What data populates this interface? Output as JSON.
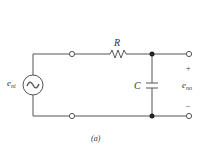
{
  "figure": {
    "caption": "(a)",
    "type": "RC low-pass circuit",
    "wire_color": "#555555"
  },
  "labels": {
    "resistor": "R",
    "capacitor": "C",
    "input_main": "e",
    "input_sub": "ni",
    "output_main": "e",
    "output_sub": "no",
    "plus": "+",
    "minus": "–",
    "source_symbol": "~"
  }
}
